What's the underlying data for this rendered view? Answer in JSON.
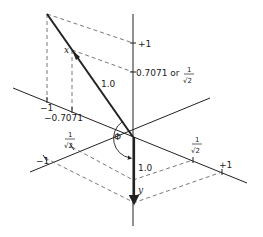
{
  "diagram": {
    "type": "vector-projection-3d",
    "colors": {
      "ink": "#222222",
      "dashed": "#555555",
      "background": "#ffffff"
    },
    "labels": {
      "plus_one_top": "+1",
      "vertical_tick": "0.7071 or",
      "frac_one": "1",
      "frac_sqrt2": "√2",
      "minus_one_left": "−1",
      "minus_0707": "−0.7071",
      "x_vector_label": "x",
      "x_magnitude": "1.0",
      "y_vector_label": "y",
      "y_magnitude": "1.0",
      "angle_label": "Φ",
      "left_axis_minus_one": "−1",
      "right_axis_plus_one": "+1"
    }
  }
}
